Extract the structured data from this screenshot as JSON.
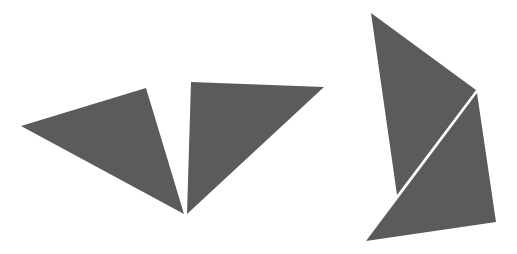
{
  "diagram": {
    "description": "Four dark gray triangles arranged as two separate groups (tangram-style pieces)",
    "colors": {
      "background": "#ffffff",
      "fill": "#5b5b5b",
      "separator": "#ffffff"
    },
    "groups": [
      {
        "name": "left-group",
        "arrangement": "two triangles meeting at a shared bottom point, forming a V",
        "shapes": [
          {
            "name": "left-triangle-1",
            "points": [
              [
                21,
                126
              ],
              [
                146,
                88
              ],
              [
                184,
                214
              ]
            ]
          },
          {
            "name": "left-triangle-2",
            "points": [
              [
                191,
                82
              ],
              [
                324,
                87
              ],
              [
                187,
                214
              ]
            ]
          }
        ]
      },
      {
        "name": "right-group",
        "arrangement": "two triangles stacked, separated by a thin diagonal white gap",
        "shapes": [
          {
            "name": "right-triangle-upper",
            "points": [
              [
                371,
                13
              ],
              [
                476,
                90
              ],
              [
                397,
                195
              ]
            ]
          },
          {
            "name": "right-triangle-lower",
            "points": [
              [
                477,
                93
              ],
              [
                496,
                222
              ],
              [
                366,
                241
              ]
            ]
          }
        ]
      }
    ]
  }
}
